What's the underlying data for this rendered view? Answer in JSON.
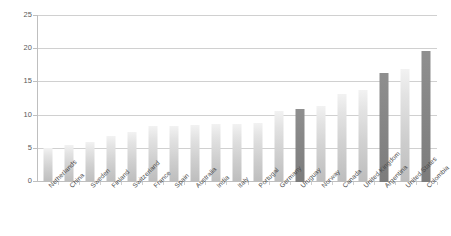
{
  "chart_data": {
    "type": "bar",
    "title": "",
    "subtitle": "",
    "xlabel": "",
    "ylabel": "",
    "ylim": [
      0,
      25
    ],
    "yticks": [
      0,
      5,
      10,
      15,
      20,
      25
    ],
    "grid": true,
    "legend": "none",
    "categories": [
      "Netherlands",
      "China",
      "Sweden",
      "Finland",
      "Switzerland",
      "France",
      "Spain",
      "Australia",
      "India",
      "Italy",
      "Portugal",
      "Germany",
      "Uruguay",
      "Norway",
      "Canada",
      "United Kingdom",
      "Argentina",
      "United States",
      "Colombia"
    ],
    "values": [
      5.1,
      5.6,
      6.1,
      6.9,
      7.5,
      8.5,
      8.5,
      8.6,
      8.7,
      8.8,
      8.9,
      10.7,
      11.0,
      11.5,
      13.2,
      13.9,
      16.4,
      17.0,
      19.8
    ],
    "highlighted": [
      false,
      false,
      false,
      false,
      false,
      false,
      false,
      false,
      false,
      false,
      false,
      false,
      true,
      false,
      false,
      false,
      true,
      false,
      true
    ],
    "colors": {
      "bar_top": "#f2f2f2",
      "bar_bottom": "#bdbdbd",
      "bar_highlight_top": "#8f8f8f",
      "bar_highlight_bottom": "#7c7c7c",
      "gridline": "#d0d0d0",
      "axis": "#bfbfbf",
      "tick_text": "#5a5a5a",
      "background": "#ffffff"
    }
  }
}
